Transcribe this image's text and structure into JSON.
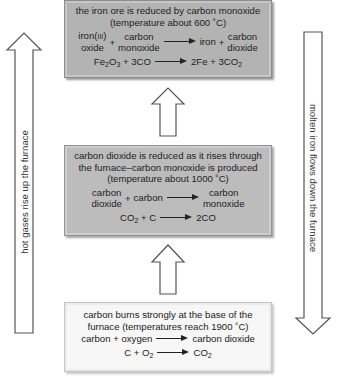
{
  "diagram": {
    "side_arrows": {
      "left": {
        "label": "hot gases rise up the furnace",
        "direction": "up"
      },
      "right": {
        "label": "molten iron flows down the furnace",
        "direction": "down"
      }
    },
    "boxes": {
      "top": {
        "heading": "the iron ore is reduced by carbon monoxide",
        "temperature": "(temperature about 600 ˚C)",
        "word_equation": {
          "reactant1_line1": "iron(",
          "reactant1_roman": "III",
          "reactant1_line1_end": ")",
          "reactant1_line2": "oxide",
          "plus1": "+",
          "reactant2_line1": "carbon",
          "reactant2_line2": "monoxide",
          "product1": "iron",
          "plus2": "+",
          "product2_line1": "carbon",
          "product2_line2": "dioxide"
        },
        "symbol_equation": {
          "left": [
            "Fe",
            "2",
            "O",
            "3",
            " + 3CO"
          ],
          "right": [
            "2Fe + 3CO",
            "2"
          ]
        },
        "fill": "#b3b3b3"
      },
      "middle": {
        "heading_line1": "carbon dioxide is reduced as it rises through",
        "heading_line2": "the furnace–carbon monoxide is produced",
        "temperature": "(temperature about 1000 ˚C)",
        "word_equation": {
          "reactant1_line1": "carbon",
          "reactant1_line2": "dioxide",
          "plus": "+",
          "reactant2": "carbon",
          "product_line1": "carbon",
          "product_line2": "monoxide"
        },
        "symbol_equation": {
          "left": [
            "CO",
            "2",
            " + C"
          ],
          "right": "2CO"
        },
        "fill": "#bcbcbc"
      },
      "bottom": {
        "heading_line1": "carbon burns strongly at the base of the",
        "heading_line2": "furnace (temperatures reach 1900 ˚C)",
        "word_equation": {
          "left": "carbon + oxygen",
          "right": "carbon dioxide"
        },
        "symbol_equation": {
          "left": [
            "C + O",
            "2"
          ],
          "right": [
            "CO",
            "2"
          ]
        },
        "fill": "#f7f7f7"
      }
    },
    "flow_arrows": [
      {
        "from": "bottom",
        "to": "middle",
        "direction": "up"
      },
      {
        "from": "middle",
        "to": "top",
        "direction": "up"
      }
    ]
  }
}
